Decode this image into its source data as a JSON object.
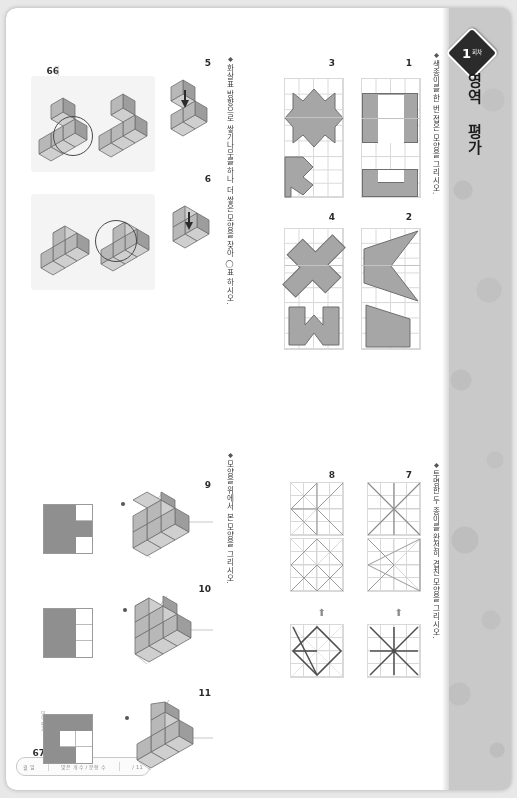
{
  "document": {
    "type": "scanned-workbook-page",
    "orientation_note": "180-degree rotated scan",
    "header_tab": {
      "items": [
        "월  일",
        "맞은 개수 / 문항 수",
        "/ 11"
      ]
    },
    "badge": {
      "number": "1",
      "unit": "회차"
    },
    "big_title": "영역 평가",
    "page_left": {
      "number": "66",
      "caption": "영역평가 1회차"
    },
    "page_right": {
      "number": "67",
      "caption": "영역 평가"
    }
  },
  "sections": [
    {
      "id": "fold",
      "instruction": "색종이를 한 번 접은 모양을 그리시오.",
      "questions": [
        "1",
        "2",
        "3",
        "4"
      ]
    },
    {
      "id": "stack-circle",
      "instruction": "화살표 방향으로 쌓기나무를 하나 더 쌓은 모양을 찾아 ◯표 하시오.",
      "questions": [
        "5",
        "6"
      ]
    },
    {
      "id": "stack-view",
      "instruction": "모양을 위에서 본 모양을 그리시오.",
      "questions": [
        "9",
        "10",
        "11"
      ]
    },
    {
      "id": "overlay",
      "instruction": "투명한 두 종이를 완전히 겹친 모양을 그리시오.",
      "questions": [
        "7",
        "8"
      ]
    }
  ],
  "colors": {
    "paper": "#ffffff",
    "page_border": "#c9c9c9",
    "shape_fill": "#a6a6a6",
    "shape_stroke": "#6f6f6f",
    "cube_top": "#d0d0d0",
    "cube_left": "#9d9d9d",
    "cube_right": "#b8b8b8",
    "grid_line": "#d9d9d9",
    "panel_bg": "#f4f4f4",
    "ink": "#2b2b2b"
  },
  "mini_views": {
    "q9": [
      [
        0,
        1,
        1
      ],
      [
        1,
        1,
        1
      ],
      [
        0,
        1,
        1
      ]
    ],
    "q10": [
      [
        0,
        1,
        1
      ],
      [
        0,
        1,
        1
      ],
      [
        0,
        1,
        1
      ]
    ],
    "q11": [
      [
        0,
        1,
        1
      ],
      [
        0,
        0,
        1
      ],
      [
        1,
        1,
        1
      ]
    ]
  }
}
